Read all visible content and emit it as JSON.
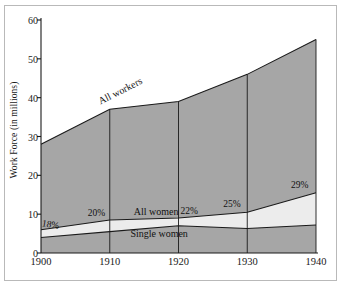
{
  "chart_data": {
    "type": "area",
    "title": "",
    "subtitle": "",
    "xlabel": "",
    "ylabel": "Work Force (in millions)",
    "x": [
      1900,
      1910,
      1920,
      1930,
      1940
    ],
    "xticklabels": [
      "1900",
      "1910",
      "1920",
      "1930",
      "1940"
    ],
    "yticklabels": [
      "0",
      "10",
      "20",
      "30",
      "40",
      "50",
      "60"
    ],
    "yticks": [
      0,
      10,
      20,
      30,
      40,
      50,
      60
    ],
    "xlim": [
      1900,
      1940
    ],
    "ylim": [
      0,
      60
    ],
    "grid": false,
    "legend_position": "inline-labels",
    "stacking": "overlaid-bands",
    "series": [
      {
        "name": "All workers",
        "values": [
          28,
          37,
          39,
          46,
          55
        ],
        "color": "#a6a6a6"
      },
      {
        "name": "All women",
        "values": [
          6,
          8.5,
          9,
          10.5,
          15.5
        ],
        "color": "#ececec"
      },
      {
        "name": "Single women",
        "values": [
          4,
          5.5,
          7,
          6.3,
          7.2
        ],
        "color": "#a6a6a6"
      }
    ],
    "annotations": [
      {
        "text": "18%",
        "x": 1900,
        "y": 6.0,
        "note": "women share of work force 1900"
      },
      {
        "text": "20%",
        "x": 1910,
        "y": 8.5,
        "note": "women share of work force 1910"
      },
      {
        "text": "22%",
        "x": 1920,
        "y": 9.0,
        "note": "women share of work force 1920"
      },
      {
        "text": "25%",
        "x": 1930,
        "y": 10.5,
        "note": "women share of work force 1930"
      },
      {
        "text": "29%",
        "x": 1940,
        "y": 15.5,
        "note": "women share of work force 1940"
      }
    ],
    "inline_labels": [
      {
        "text": "All workers",
        "series": "All workers"
      },
      {
        "text": "All women",
        "series": "All women"
      },
      {
        "text": "Single women",
        "series": "Single women"
      }
    ]
  },
  "colors": {
    "fill_dark": "#a6a6a6",
    "fill_light": "#ececec",
    "line": "#1a1a1a",
    "axis": "#1a1a1a",
    "frame": "#b9b9b9",
    "background": "#ffffff"
  },
  "axis": {
    "ytick_0": "0",
    "ytick_10": "10",
    "ytick_20": "20",
    "ytick_30": "30",
    "ytick_40": "40",
    "ytick_50": "50",
    "ytick_60": "60",
    "xtick_1900": "1900",
    "xtick_1910": "1910",
    "xtick_1920": "1920",
    "xtick_1930": "1930",
    "xtick_1940": "1940",
    "ylabel": "Work Force (in millions)"
  },
  "labels": {
    "all_workers": "All workers",
    "all_women": "All women",
    "single_women": "Single women",
    "pct_1900": "18%",
    "pct_1910": "20%",
    "pct_1920": "22%",
    "pct_1930": "25%",
    "pct_1940": "29%"
  }
}
